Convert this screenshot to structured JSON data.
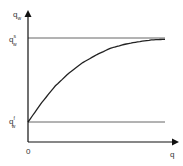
{
  "chart_data": {
    "type": "line",
    "title": "",
    "xlabel": "q",
    "ylabel": "q_w",
    "x_tick_labels": [
      "0"
    ],
    "y_tick_labels": [
      "q^s_w",
      "q^f_w"
    ],
    "reference_lines": [
      {
        "name": "upper-asymptote",
        "label": "q^s_w",
        "y_rel": 0.8
      },
      {
        "name": "lower-level",
        "label": "q^f_w",
        "y_rel": 0.15
      }
    ],
    "series": [
      {
        "name": "q_w(q)",
        "description": "concave increasing curve rising from q^f_w at q=0 and saturating toward q^s_w",
        "x": [
          0,
          0.1,
          0.2,
          0.3,
          0.4,
          0.5,
          0.6,
          0.7,
          0.8,
          0.9,
          1.0
        ],
        "y_rel": [
          0.15,
          0.3,
          0.43,
          0.53,
          0.61,
          0.67,
          0.72,
          0.75,
          0.77,
          0.785,
          0.79
        ]
      }
    ],
    "grid": false,
    "legend": "none"
  },
  "labels": {
    "y_axis_main": "q",
    "y_axis_sub": "w",
    "upper_main": "q",
    "upper_sup": "s",
    "upper_sub": "w",
    "lower_main": "q",
    "lower_sup": "f",
    "lower_sub": "w",
    "origin": "0",
    "x_axis": "q"
  },
  "colors": {
    "axis": "#111111",
    "reference_line": "#555555",
    "curve": "#222222",
    "text": "#333333"
  }
}
